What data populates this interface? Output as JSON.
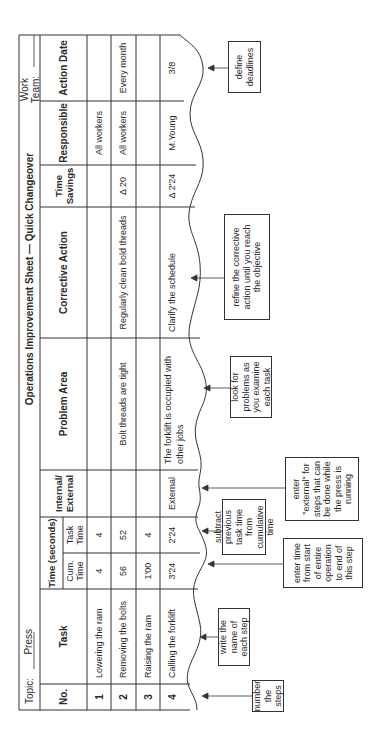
{
  "sheet": {
    "topic_label": "Topic:",
    "topic_value": "Press",
    "title": "Operations Improvement Sheet — Quick Changeover",
    "work_team_label": "Work Team:",
    "work_team_value": ""
  },
  "columns": {
    "no": "No.",
    "task": "Task",
    "time_group": "Time (seconds)",
    "cum_time": "Cum. Time",
    "task_time": "Task Time",
    "internal_external": "Internal/ External",
    "problem_area": "Problem Area",
    "corrective_action": "Corrective Action",
    "time_savings": "Time Savings",
    "responsible": "Responsible",
    "action_date": "Action Date"
  },
  "rows": [
    {
      "no": "1",
      "task": "Lowering the ram",
      "cum_time": "4",
      "task_time": "4",
      "internal_external": "",
      "problem_area": "",
      "corrective_action": "",
      "time_savings": "",
      "responsible": "All workers",
      "action_date": ""
    },
    {
      "no": "2",
      "task": "Removing the bolts",
      "cum_time": "56",
      "task_time": "52",
      "internal_external": "",
      "problem_area": "Bolt threads are tight",
      "corrective_action": "Regularly clean bold threads",
      "time_savings": "Δ 20",
      "responsible": "All workers",
      "action_date": "Every month"
    },
    {
      "no": "3",
      "task": "Raising the ram",
      "cum_time": "1'00",
      "task_time": "4",
      "internal_external": "",
      "problem_area": "",
      "corrective_action": "",
      "time_savings": "",
      "responsible": "",
      "action_date": ""
    },
    {
      "no": "4",
      "task": "Calling the forklift",
      "cum_time": "3'24",
      "task_time": "2'24",
      "internal_external": "External",
      "problem_area": "The forklift is occupied with other jobs",
      "corrective_action": "Clarify the schedule",
      "time_savings": "Δ 2'24",
      "responsible": "M.Young",
      "action_date": "3/8"
    }
  ],
  "callouts": {
    "number_steps": "number the steps",
    "name_steps": "write the name of each step",
    "cum_time": "enter time from start of entire operation to end of this step",
    "task_time": "subtract previous task time from cumulative time",
    "external": "enter \"external\" for steps that can be done while the press is running",
    "problems": "look for problems as you examine each task",
    "corrective": "refine the corrective action until you reach the objective",
    "deadlines": "define deadlines"
  }
}
